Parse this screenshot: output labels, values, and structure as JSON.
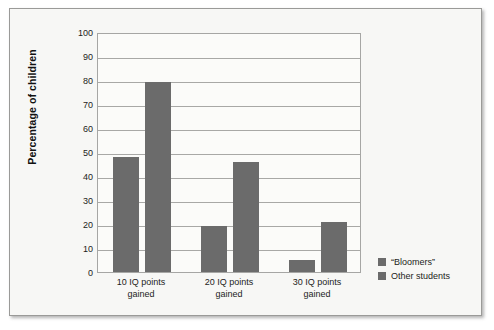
{
  "chart_data": {
    "type": "bar",
    "title": "",
    "xlabel": "",
    "ylabel": "Percentage of children",
    "ylim": [
      0,
      100
    ],
    "ytick_step": 10,
    "yticks": [
      "100",
      "90",
      "80",
      "70",
      "60",
      "50",
      "40",
      "30",
      "20",
      "10",
      "0"
    ],
    "grid": true,
    "legend_position": "right-bottom",
    "categories": [
      "10 IQ points gained",
      "20 IQ points gained",
      "30 IQ points gained"
    ],
    "category_lines": [
      [
        "10 IQ points",
        "gained"
      ],
      [
        "20 IQ points",
        "gained"
      ],
      [
        "30 IQ points",
        "gained"
      ]
    ],
    "series": [
      {
        "name": "“Bloomers”",
        "values": [
          48,
          19,
          5
        ],
        "color": "#6b6b6b"
      },
      {
        "name": "Other students",
        "values": [
          79,
          46,
          21
        ],
        "color": "#6b6b6b"
      }
    ]
  },
  "legend": {
    "items": [
      {
        "label": "“Bloomers”"
      },
      {
        "label": "Other students"
      }
    ]
  },
  "colors": {
    "bar": "#6b6b6b",
    "gridline": "#a8a8a6",
    "plot_border": "#a6a6a4",
    "frame_border": "#9a9a98",
    "frame_background": "#f7f7f5",
    "plot_background": "#fbfbf9",
    "text": "#1d1d1b"
  }
}
